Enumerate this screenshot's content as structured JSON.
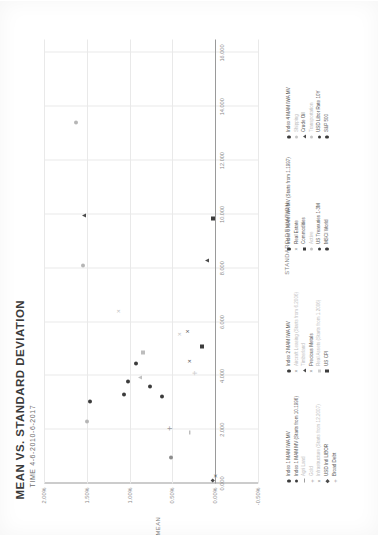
{
  "chart_data": {
    "type": "scatter",
    "title": "MEAN VS. STANDARD DEVIATION",
    "subtitle": "TIME 4-6-2010-6-2017",
    "xlabel": "STANDARD DEVIATION",
    "ylabel": "MEAN",
    "xlim": [
      0,
      16.5
    ],
    "ylim": [
      -0.5,
      2.0
    ],
    "grid": true,
    "legend_position": "bottom",
    "xticks": [
      "0.000",
      "2.000",
      "4.000",
      "6.000",
      "8.000",
      "10.000",
      "12.000",
      "14.000",
      "16.000"
    ],
    "xtick_values": [
      0,
      2,
      4,
      6,
      8,
      10,
      12,
      14,
      16
    ],
    "yticks": [
      "-0.50%",
      "0.00%",
      "0.50%",
      "1.00%",
      "1.50%",
      "2.00%"
    ],
    "ytick_values": [
      -0.5,
      0,
      0.5,
      1.0,
      1.5,
      2.0
    ],
    "points": [
      {
        "label": "Index 1 MAM IWA MV",
        "marker": "dot",
        "tone": "dark",
        "x": 3.3,
        "y": 1.06
      },
      {
        "label": "Index 1 MAM MV (Starts from 10.1996)",
        "marker": "dot",
        "tone": "dark",
        "x": 4.45,
        "y": 0.93
      },
      {
        "label": "Agri Land",
        "marker": "dash",
        "tone": "mid",
        "x": 1.9,
        "y": 0.3
      },
      {
        "label": "Gold",
        "marker": "plus",
        "tone": "faint",
        "x": 4.1,
        "y": 0.24
      },
      {
        "label": "Infrastructure (Starts from 12.2007)",
        "marker": "x",
        "tone": "faint",
        "x": 5.55,
        "y": 0.42
      },
      {
        "label": "USD Intl LIBOR",
        "marker": "dia",
        "tone": "dark",
        "x": 0.12,
        "y": 0.02
      },
      {
        "label": "Broad Debt",
        "marker": "plus",
        "tone": "mid",
        "x": 2.05,
        "y": 0.53
      },
      {
        "label": "Index 2 MAM IWA MV",
        "marker": "dot",
        "tone": "dark",
        "x": 3.8,
        "y": 1.02
      },
      {
        "label": "Aircraft Leasing (Starts from 6.2006)",
        "marker": "x",
        "tone": "faint",
        "x": 6.4,
        "y": 1.14
      },
      {
        "label": "Timberland",
        "marker": "tri",
        "tone": "faint",
        "x": 3.95,
        "y": 0.88
      },
      {
        "label": "Precious Metals",
        "marker": "x",
        "tone": "dark",
        "x": 5.65,
        "y": 0.33
      },
      {
        "label": "Real Assets (Starts from 1.2006)",
        "marker": "sq",
        "tone": "faint",
        "x": 4.85,
        "y": 0.84
      },
      {
        "label": "US CPI",
        "marker": "sq",
        "tone": "dark",
        "x": 5.1,
        "y": 0.15
      },
      {
        "label": "Index 3 MAM IWA MV (Starts from 1.1997)",
        "marker": "dot",
        "tone": "dark",
        "x": 3.05,
        "y": 1.46
      },
      {
        "label": "Real Estate",
        "marker": "x",
        "tone": "dark",
        "x": 0.28,
        "y": 0.0
      },
      {
        "label": "Commodities",
        "marker": "sq",
        "tone": "dark",
        "x": 9.85,
        "y": 0.02
      },
      {
        "label": "Active",
        "marker": "dot",
        "tone": "faint",
        "x": 2.3,
        "y": 1.5
      },
      {
        "label": "US Treasuries 1-3M",
        "marker": "dot",
        "tone": "dark",
        "x": 3.6,
        "y": 0.76
      },
      {
        "label": "MSCI World",
        "marker": "x",
        "tone": "dark",
        "x": 4.55,
        "y": 0.31
      },
      {
        "label": "Index 4 MAM IWA MV",
        "marker": "tri",
        "tone": "dark",
        "x": 9.95,
        "y": 1.53
      },
      {
        "label": "Shipping",
        "marker": "dot",
        "tone": "faint",
        "x": 13.4,
        "y": 1.63
      },
      {
        "label": "Crude Oil",
        "marker": "tri",
        "tone": "dark",
        "x": 8.3,
        "y": 0.1
      },
      {
        "label": "Transportation",
        "marker": "dot",
        "tone": "faint",
        "x": 8.1,
        "y": 1.55
      },
      {
        "label": "USD Libor Rate 10Y",
        "marker": "dot",
        "tone": "dark",
        "x": 3.25,
        "y": 0.62
      },
      {
        "label": "S&P 500",
        "marker": "dot",
        "tone": "mid",
        "x": 0.95,
        "y": 0.52
      }
    ],
    "legend_columns": [
      {
        "items": [
          {
            "label": "Index 1 MAM IWA MV",
            "marker": "dot",
            "faded": false
          },
          {
            "label": "Index 1 MAM MV (Starts from 10.1996)",
            "marker": "dot",
            "faded": false
          },
          {
            "label": "Agri Land",
            "marker": "dash",
            "faded": true
          },
          {
            "label": "Gold",
            "marker": "plus",
            "faded": true
          },
          {
            "label": "Infrastructure (Starts from 12.2007)",
            "marker": "x",
            "faded": true
          },
          {
            "label": "USD Intl LIBOR",
            "marker": "dia",
            "faded": false
          },
          {
            "label": "Broad Debt",
            "marker": "plus",
            "faded": false
          }
        ]
      },
      {
        "items": [
          {
            "label": "Index 2 MAM IWA MV",
            "marker": "dot",
            "faded": false
          },
          {
            "label": "Aircraft Leasing (Starts from 6.2006)",
            "marker": "x",
            "faded": true
          },
          {
            "label": "Timberland",
            "marker": "tri",
            "faded": true
          },
          {
            "label": "Precious Metals",
            "marker": "x",
            "faded": false
          },
          {
            "label": "Real Assets (Starts from 1.2006)",
            "marker": "sq",
            "faded": true
          },
          {
            "label": "US CPI",
            "marker": "sq",
            "faded": false
          }
        ]
      },
      {
        "items": [
          {
            "label": "Index 3 MAM IWA MV (Starts from 1.1997)",
            "marker": "dot",
            "faded": false
          },
          {
            "label": "Real Estate",
            "marker": "x",
            "faded": false
          },
          {
            "label": "Commodities",
            "marker": "sq",
            "faded": false
          },
          {
            "label": "Active",
            "marker": "dot",
            "faded": true
          },
          {
            "label": "US Treasuries 1-3M",
            "marker": "dot",
            "faded": false
          },
          {
            "label": "MSCI World",
            "marker": "dot",
            "faded": false
          }
        ]
      },
      {
        "items": [
          {
            "label": "Index 4 MAM IWA MV",
            "marker": "dot",
            "faded": false
          },
          {
            "label": "Shipping",
            "marker": "dot",
            "faded": true
          },
          {
            "label": "Crude Oil",
            "marker": "tri",
            "faded": false
          },
          {
            "label": "Transportation",
            "marker": "dot",
            "faded": true
          },
          {
            "label": "USD Libor Rate 10Y",
            "marker": "dot",
            "faded": false
          },
          {
            "label": "S&P 500",
            "marker": "dot",
            "faded": false
          }
        ]
      }
    ]
  },
  "page": {
    "corner_note": ""
  }
}
